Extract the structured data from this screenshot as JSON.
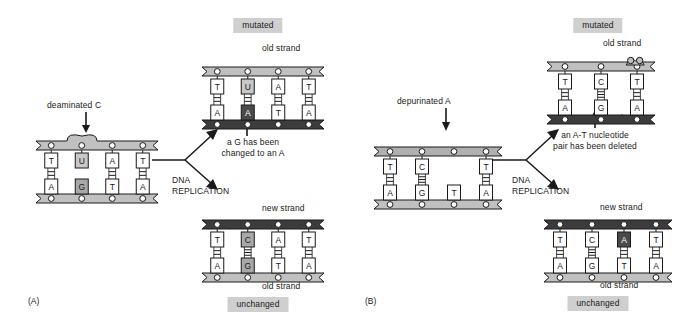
{
  "figure": {
    "type": "biology-diagram",
    "panels": [
      {
        "id": "A",
        "panel_label": "(A)",
        "lesion_label": "deaminated C",
        "process_label_line1": "DNA",
        "process_label_line2": "REPLICATION",
        "outcome_note_line1": "a G has been",
        "outcome_note_line2": "changed to an A",
        "badges": {
          "top": "mutated",
          "bottom": "unchanged"
        },
        "strand_labels": {
          "mutated_top": "old strand",
          "mutated_bottom": "new strand",
          "unchanged_top": "new strand",
          "unchanged_bottom": "old strand"
        },
        "parent_dna": {
          "top_strand_tone": "light",
          "bottom_strand_tone": "light",
          "has_lesion_bulge": true,
          "pairs": [
            {
              "top": "T",
              "bottom": "A",
              "top_tone": "white",
              "bottom_tone": "white",
              "bonds": 2
            },
            {
              "top": "U",
              "bottom": "G",
              "top_tone": "light",
              "bottom_tone": "mid",
              "bonds": 0
            },
            {
              "top": "A",
              "bottom": "T",
              "top_tone": "white",
              "bottom_tone": "white",
              "bonds": 2
            },
            {
              "top": "T",
              "bottom": "A",
              "top_tone": "white",
              "bottom_tone": "white",
              "bonds": 2
            }
          ]
        },
        "mutated_dna": {
          "top_strand_tone": "light",
          "bottom_strand_tone": "dark",
          "pairs": [
            {
              "top": "T",
              "bottom": "A",
              "top_tone": "white",
              "bottom_tone": "white",
              "bonds": 2
            },
            {
              "top": "U",
              "bottom": "A",
              "top_tone": "light",
              "bottom_tone": "dark",
              "bonds": 2
            },
            {
              "top": "A",
              "bottom": "T",
              "top_tone": "white",
              "bottom_tone": "white",
              "bonds": 2
            },
            {
              "top": "T",
              "bottom": "A",
              "top_tone": "white",
              "bottom_tone": "white",
              "bonds": 2
            }
          ]
        },
        "unchanged_dna": {
          "top_strand_tone": "dark",
          "bottom_strand_tone": "light",
          "pairs": [
            {
              "top": "T",
              "bottom": "A",
              "top_tone": "white",
              "bottom_tone": "white",
              "bonds": 2
            },
            {
              "top": "C",
              "bottom": "G",
              "top_tone": "mid",
              "bottom_tone": "mid",
              "bonds": 3
            },
            {
              "top": "A",
              "bottom": "T",
              "top_tone": "white",
              "bottom_tone": "white",
              "bonds": 2
            },
            {
              "top": "T",
              "bottom": "A",
              "top_tone": "white",
              "bottom_tone": "white",
              "bonds": 2
            }
          ]
        }
      },
      {
        "id": "B",
        "panel_label": "(B)",
        "lesion_label": "depurinated A",
        "process_label_line1": "DNA",
        "process_label_line2": "REPLICATION",
        "outcome_note_line1": "an A-T nucleotide",
        "outcome_note_line2": "pair has been deleted",
        "badges": {
          "top": "mutated",
          "bottom": "unchanged"
        },
        "strand_labels": {
          "mutated_top": "old strand",
          "mutated_bottom": "new strand",
          "unchanged_top": "new strand",
          "unchanged_bottom": "old strand"
        },
        "parent_dna": {
          "top_strand_tone": "mid",
          "bottom_strand_tone": "light",
          "has_missing_base": true,
          "pairs": [
            {
              "top": "T",
              "bottom": "A",
              "top_tone": "white",
              "bottom_tone": "white",
              "bonds": 2
            },
            {
              "top": "C",
              "bottom": "G",
              "top_tone": "white",
              "bottom_tone": "white",
              "bonds": 3
            },
            {
              "top": "",
              "bottom": "T",
              "top_tone": "none",
              "bottom_tone": "white",
              "bonds": 0
            },
            {
              "top": "T",
              "bottom": "A",
              "top_tone": "white",
              "bottom_tone": "white",
              "bonds": 2
            }
          ]
        },
        "mutated_dna": {
          "top_strand_tone": "light",
          "bottom_strand_tone": "dark",
          "has_deletion_pinch": true,
          "pairs": [
            {
              "top": "T",
              "bottom": "A",
              "top_tone": "white",
              "bottom_tone": "white",
              "bonds": 2
            },
            {
              "top": "C",
              "bottom": "G",
              "top_tone": "white",
              "bottom_tone": "white",
              "bonds": 3
            },
            {
              "top": "T",
              "bottom": "A",
              "top_tone": "white",
              "bottom_tone": "white",
              "bonds": 2
            }
          ]
        },
        "unchanged_dna": {
          "top_strand_tone": "dark",
          "bottom_strand_tone": "light",
          "pairs": [
            {
              "top": "T",
              "bottom": "A",
              "top_tone": "white",
              "bottom_tone": "white",
              "bonds": 2
            },
            {
              "top": "C",
              "bottom": "G",
              "top_tone": "white",
              "bottom_tone": "white",
              "bonds": 3
            },
            {
              "top": "A",
              "bottom": "T",
              "top_tone": "dark",
              "bottom_tone": "white",
              "bonds": 2
            },
            {
              "top": "T",
              "bottom": "A",
              "top_tone": "white",
              "bottom_tone": "white",
              "bonds": 2
            }
          ]
        }
      }
    ]
  },
  "colors": {
    "strand_light": "#c0c0c0",
    "strand_mid": "#b0b0b0",
    "strand_dark": "#3c3c3c",
    "base_white": "#ffffff",
    "base_light": "#c8c8c8",
    "base_mid": "#a8a8a8",
    "base_dark": "#4a4a4a",
    "outline": "#1a1a1a",
    "badge_bg": "#cfcfcf",
    "text": "#1a1a1a"
  }
}
